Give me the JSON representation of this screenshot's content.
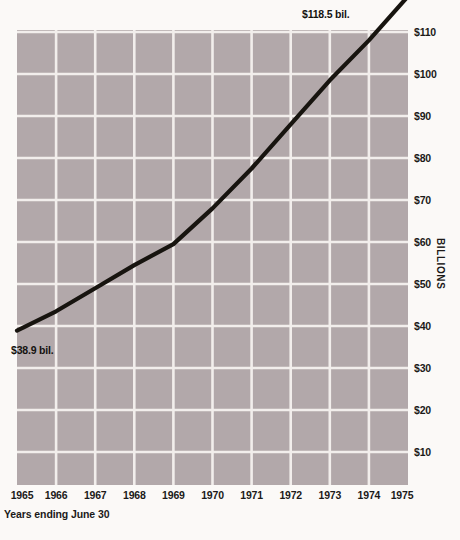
{
  "chart_data": {
    "type": "line",
    "title": "",
    "subtitle": "",
    "xlabel": "Years ending June 30",
    "ylabel": "BILLIONS",
    "x": [
      1965,
      1966,
      1967,
      1968,
      1969,
      1970,
      1971,
      1972,
      1973,
      1974,
      1975
    ],
    "values": [
      38.9,
      43.5,
      49.0,
      54.5,
      59.5,
      68.0,
      77.5,
      88.0,
      98.5,
      108.0,
      118.5
    ],
    "series": [
      {
        "name": "Amount",
        "values": [
          38.9,
          43.5,
          49.0,
          54.5,
          59.5,
          68.0,
          77.5,
          88.0,
          98.5,
          108.0,
          118.5
        ]
      }
    ],
    "xlim": [
      1965,
      1975
    ],
    "ylim": [
      0,
      115
    ],
    "x_tick_labels": [
      "1965",
      "1966",
      "1967",
      "1968",
      "1969",
      "1970",
      "1971",
      "1972",
      "1973",
      "1974",
      "1975"
    ],
    "y_tick_labels": [
      "$110",
      "$100",
      "$90",
      "$80",
      "$70",
      "$60",
      "$50",
      "$40",
      "$30",
      "$20",
      "$10"
    ],
    "y_tick_values": [
      110,
      100,
      90,
      80,
      70,
      60,
      50,
      40,
      30,
      20,
      10
    ],
    "grid": true,
    "legend": "none",
    "annotations": [
      {
        "text": "$118.5 bil.",
        "x": 1975,
        "y": 118.5,
        "position": "top-right"
      },
      {
        "text": "$38.9 bil.",
        "x": 1965,
        "y": 38.9,
        "position": "bottom-left"
      }
    ],
    "colors": {
      "plot_background": "#b2a8aa",
      "page_background": "#fbf9f7",
      "gridline": "#f2eeec",
      "line": "#17140f",
      "text": "#1c1a19"
    }
  },
  "axes": {
    "y_title": "BILLIONS",
    "x_caption": "Years ending June 30",
    "y_ticks": [
      {
        "label": "$110",
        "value": 110
      },
      {
        "label": "$100",
        "value": 100
      },
      {
        "label": "$90",
        "value": 90
      },
      {
        "label": "$80",
        "value": 80
      },
      {
        "label": "$70",
        "value": 70
      },
      {
        "label": "$60",
        "value": 60
      },
      {
        "label": "$50",
        "value": 50
      },
      {
        "label": "$40",
        "value": 40
      },
      {
        "label": "$30",
        "value": 30
      },
      {
        "label": "$20",
        "value": 20
      },
      {
        "label": "$10",
        "value": 10
      }
    ],
    "x_ticks": [
      {
        "label": "1965"
      },
      {
        "label": "1966"
      },
      {
        "label": "1967"
      },
      {
        "label": "1968"
      },
      {
        "label": "1969"
      },
      {
        "label": "1970"
      },
      {
        "label": "1971"
      },
      {
        "label": "1972"
      },
      {
        "label": "1973"
      },
      {
        "label": "1974"
      },
      {
        "label": "1975"
      }
    ]
  },
  "annotations": {
    "end_label": "$118.5 bil.",
    "start_label": "$38.9 bil."
  }
}
